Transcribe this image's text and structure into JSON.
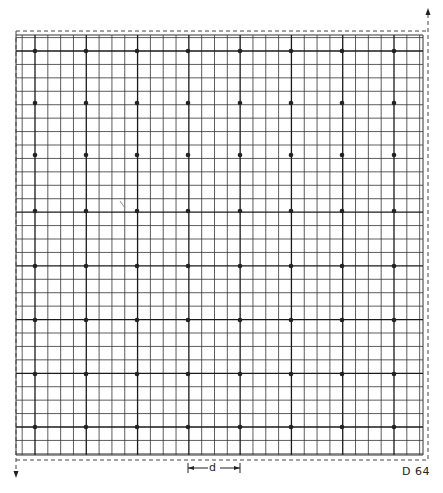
{
  "figure": {
    "label": "D 64",
    "dimension_label": "d"
  },
  "grid": {
    "left": 16,
    "top": 35,
    "right": 423,
    "bottom": 455,
    "dot_columns_x": [
      35,
      86,
      137,
      188,
      240,
      291,
      342,
      394
    ],
    "dot_rows_y": [
      51,
      103,
      155,
      211,
      266,
      320,
      374,
      427
    ],
    "subdivisions_per_cell": 4,
    "line_color": "#333333",
    "heavy_line_color": "#1a1a1a",
    "dot_color": "#222222",
    "dot_radius": 2.3
  },
  "boundary": {
    "top_dashed_y": 31,
    "bottom_dashed_y": 460,
    "left_dashed_x": 16,
    "right_dashed_x": 428,
    "arrow_up": {
      "x": 428,
      "y": 8
    },
    "arrow_down": {
      "x": 16,
      "y": 478
    }
  },
  "dimension": {
    "x1": 188,
    "x2": 240,
    "y": 468
  },
  "stray_mark": {
    "x": 122,
    "y": 205
  }
}
